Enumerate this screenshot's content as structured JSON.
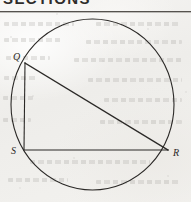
{
  "page": {
    "kind": "scanned-textbook-geometry-figure",
    "heading_partial": "SECTIONS",
    "background_color": "#f2f1ee",
    "ink_color": "#2b2927",
    "rule_color": "#55524e"
  },
  "figure": {
    "name": "circle-with-inscribed-right-triangle",
    "stroke_color": "#2b2927",
    "stroke_width": 1,
    "circle": {
      "center_x": 92.5,
      "center_y": 104.5,
      "radius_x": 81.5,
      "radius_y": 85.5
    },
    "labels": {
      "q": "Q",
      "s": "S",
      "r": "R"
    },
    "points": {
      "q": {
        "x": 25,
        "y": 63
      },
      "s": {
        "x": 24,
        "y": 150
      },
      "r": {
        "x": 168,
        "y": 150
      }
    },
    "label_positions": {
      "q": {
        "x": 13,
        "y": 60
      },
      "s": {
        "x": 11,
        "y": 154
      },
      "r": {
        "x": 173,
        "y": 156
      }
    },
    "segments": [
      {
        "name": "segment-qs",
        "from": "q",
        "to": "s"
      },
      {
        "name": "segment-sr",
        "from": "s",
        "to": "r"
      },
      {
        "name": "segment-qr",
        "from": "q",
        "to": "r"
      }
    ]
  },
  "ghost_text_lines": [
    {
      "left": 4,
      "top": 22,
      "width": 70
    },
    {
      "left": 96,
      "top": 22,
      "width": 84
    },
    {
      "left": 4,
      "top": 38,
      "width": 58
    },
    {
      "left": 86,
      "top": 40,
      "width": 96
    },
    {
      "left": 6,
      "top": 56,
      "width": 44
    },
    {
      "left": 74,
      "top": 58,
      "width": 108
    },
    {
      "left": 4,
      "top": 76,
      "width": 34
    },
    {
      "left": 88,
      "top": 78,
      "width": 94
    },
    {
      "left": 3,
      "top": 96,
      "width": 30
    },
    {
      "left": 104,
      "top": 98,
      "width": 78
    },
    {
      "left": 3,
      "top": 118,
      "width": 28
    },
    {
      "left": 100,
      "top": 120,
      "width": 82
    },
    {
      "left": 30,
      "top": 160,
      "width": 120
    },
    {
      "left": 8,
      "top": 178,
      "width": 60
    },
    {
      "left": 96,
      "top": 180,
      "width": 84
    }
  ]
}
